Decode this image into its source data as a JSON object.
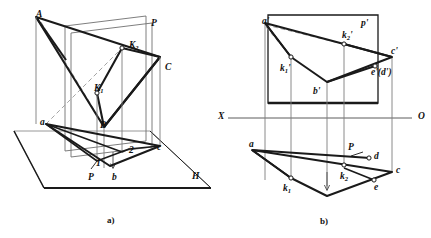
{
  "figure": {
    "captions": [
      {
        "id": "caption-a",
        "text": "a)",
        "x": 107,
        "y": 215
      },
      {
        "id": "caption-b",
        "text": "b)",
        "x": 320,
        "y": 216
      }
    ],
    "colors": {
      "stroke_heavy": "#1a1a1a",
      "stroke_light": "#7a7a7a",
      "dashed": "#8a8a8a",
      "background": "#ffffff",
      "marker_fill": "#ffffff"
    }
  },
  "panel_a": {
    "name": "pictorial-3d-view",
    "labels": [
      {
        "id": "label-A",
        "base": "A",
        "sub": "",
        "prime": "",
        "x": 36,
        "y": 10
      },
      {
        "id": "label-P-plane",
        "base": "P",
        "sub": "",
        "prime": "",
        "x": 151,
        "y": 19
      },
      {
        "id": "label-K2",
        "base": "K",
        "sub": "2",
        "prime": "",
        "x": 129,
        "y": 41
      },
      {
        "id": "label-C",
        "base": "C",
        "sub": "",
        "prime": "",
        "x": 165,
        "y": 63
      },
      {
        "id": "label-K1",
        "base": "K",
        "sub": "1",
        "prime": "",
        "x": 94,
        "y": 84
      },
      {
        "id": "label-B",
        "base": "B",
        "sub": "",
        "prime": "",
        "x": 100,
        "y": 121
      },
      {
        "id": "label-a-small",
        "base": "a",
        "sub": "",
        "prime": "",
        "x": 40,
        "y": 118
      },
      {
        "id": "label-2-small",
        "base": "2",
        "sub": "",
        "prime": "",
        "x": 129,
        "y": 146
      },
      {
        "id": "label-c-small",
        "base": "c",
        "sub": "",
        "prime": "",
        "x": 157,
        "y": 143
      },
      {
        "id": "label-1-small",
        "base": "1",
        "sub": "",
        "prime": "",
        "x": 96,
        "y": 159
      },
      {
        "id": "label-P-trace",
        "base": "P",
        "sub": "",
        "prime": "",
        "x": 88,
        "y": 173
      },
      {
        "id": "label-b-small",
        "base": "b",
        "sub": "",
        "prime": "",
        "x": 112,
        "y": 173
      },
      {
        "id": "label-H-plane",
        "base": "H",
        "sub": "",
        "prime": "",
        "x": 192,
        "y": 172
      }
    ]
  },
  "panel_b": {
    "name": "orthographic-projection-view",
    "axis": {
      "left_label": "X",
      "right_label": "O",
      "left_x": 218,
      "right_x": 420,
      "y": 118
    },
    "labels": [
      {
        "id": "label-a-prime",
        "base": "a",
        "sub": "",
        "prime": "'",
        "x": 262,
        "y": 17
      },
      {
        "id": "label-p-prime",
        "base": "p",
        "sub": "",
        "prime": "'",
        "x": 361,
        "y": 19
      },
      {
        "id": "label-k2-prime",
        "base": "k",
        "sub": "2",
        "prime": "'",
        "x": 342,
        "y": 37
      },
      {
        "id": "label-c-prime",
        "base": "c",
        "sub": "",
        "prime": "'",
        "x": 390,
        "y": 52
      },
      {
        "id": "label-k1-prime",
        "base": "k",
        "sub": "1",
        "prime": "'",
        "x": 290,
        "y": 64
      },
      {
        "id": "label-ed-prime",
        "base": "e",
        "sub": "",
        "prime": "'(d')",
        "x": 371,
        "y": 71
      },
      {
        "id": "label-b-prime",
        "base": "b",
        "sub": "",
        "prime": "'",
        "x": 313,
        "y": 89
      },
      {
        "id": "label-a-plain",
        "base": "a",
        "sub": "",
        "prime": "",
        "x": 252,
        "y": 142
      },
      {
        "id": "label-P-trace-b",
        "base": "P",
        "sub": "",
        "prime": "",
        "x": 348,
        "y": 148
      },
      {
        "id": "label-d-plain",
        "base": "d",
        "sub": "",
        "prime": "",
        "x": 372,
        "y": 154
      },
      {
        "id": "label-c-plain",
        "base": "c",
        "sub": "",
        "prime": "",
        "x": 403,
        "y": 170
      },
      {
        "id": "label-k2-plain",
        "base": "k",
        "sub": "2",
        "prime": "",
        "x": 347,
        "y": 175
      },
      {
        "id": "label-e-plain",
        "base": "e",
        "sub": "",
        "prime": "",
        "x": 373,
        "y": 187
      },
      {
        "id": "label-k1-plain",
        "base": "k",
        "sub": "1",
        "prime": "",
        "x": 285,
        "y": 189
      }
    ]
  },
  "geometry": {
    "panel_a": {
      "h_plane_parallelogram": "M14,131 L150,131 L211,188 L44,188 Z",
      "h_plane_front_edge": "M44,188 L211,188",
      "p_plane_quad": "M65,26 L146,16 L146,141 L65,151 Z",
      "triangle_A_B_C": "M36,17 L104,127 L160,57 Z",
      "top_ridge_left": "M36,17 L80,47",
      "kite_K1_K2_B": "M97,93 L122,48 L160,57 L104,127 Z",
      "vertical_A": "M36,17 L36,122",
      "vertical_C": "M160,57 L160,146",
      "vertical_K2": "M122,48 L122,152",
      "vertical_K1": "M97,93 L97,160",
      "vertical_B": "M104,127 L104,166",
      "bottom_poly_a_b_c": "M46,124 L110,165 L160,146 Z",
      "bottom_poly_inner": "M46,124 L97,160 L129,149 Z",
      "dashed_a_to_K2": "M46,124 L122,48",
      "dashed_A_lower": "M36,17 L75,110",
      "trace_P_bottom": "M65,151 L146,141",
      "trace_P_lower2": "M71,157 L152,147"
    },
    "panel_b": {
      "p_rect": "M268,16 L378,16 L378,103 L268,103 Z",
      "front_shape": "M265,24 L344,44 L392,57 L327,82 L291,57 Z",
      "front_dashed": "M265,24 L344,44",
      "verticals": [
        "M265,24 L265,180",
        "M291,57 L291,178",
        "M327,82 L327,185",
        "M344,44 L344,168",
        "M392,57 L392,172"
      ],
      "top_shape": "M252,150 L392,172 L327,196 L291,178 Z",
      "top_shape2": "M252,150 L372,160 L344,168",
      "p_trace_top": "M344,160 L365,152"
    }
  }
}
